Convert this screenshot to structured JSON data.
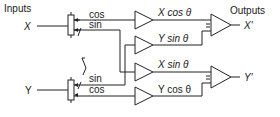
{
  "diagram": {
    "inputs_label": "Inputs",
    "outputs_label": "Outputs",
    "input_x": "X",
    "input_y": "Y",
    "output_x": "X′",
    "output_y": "Y′",
    "resolver_x": {
      "cos_label": "cos",
      "sin_label": "sin"
    },
    "resolver_y": {
      "sin_label": "sin",
      "cos_label": "cos"
    },
    "amplifiers": [
      {
        "label": "X cos θ"
      },
      {
        "label": "Y sin θ"
      },
      {
        "label": "X sin θ"
      },
      {
        "label": "Y cos θ"
      }
    ],
    "summers": [
      {
        "inputs_sign": "–",
        "output": "X′"
      },
      {
        "inputs_sign": "–",
        "output": "Y′"
      }
    ]
  }
}
